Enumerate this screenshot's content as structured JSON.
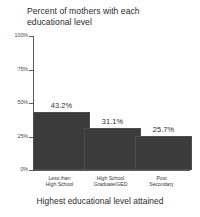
{
  "chart_data": {
    "type": "bar",
    "title": "Percent of mothers with each\neducational level",
    "xlabel": "Highest educational level attained",
    "ylabel": "",
    "categories": [
      "Less than\nHigh School",
      "High School\nGraduate/GED",
      "Post\nSecondary"
    ],
    "values": [
      43.2,
      31.1,
      25.7
    ],
    "value_labels": [
      "43.2%",
      "31.1%",
      "25.7%"
    ],
    "ylim": [
      0,
      100
    ],
    "yticks": [
      0,
      25,
      50,
      75,
      100
    ],
    "ytick_labels": [
      "0%",
      "25%",
      "50%",
      "75%",
      "100%"
    ],
    "grid": false,
    "legend": false,
    "bar_color": "#3b3b3b",
    "axis_color": "#5a5a5a",
    "text_color": "#2b2b2b",
    "background": "#ffffff"
  }
}
